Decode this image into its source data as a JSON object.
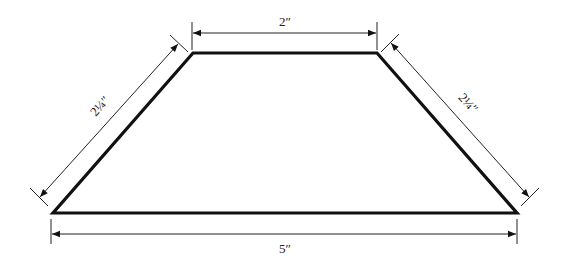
{
  "diagram": {
    "shape": "trapezoid",
    "colors": {
      "stroke": "#111111",
      "dim": "#222222",
      "background": "#ffffff"
    },
    "vertices": {
      "top_left": [
        193,
        53
      ],
      "top_right": [
        377,
        53
      ],
      "bottom_right": [
        517,
        213
      ],
      "bottom_left": [
        53,
        213
      ]
    },
    "dimensions": {
      "top": {
        "label": "2″",
        "value": "2 in"
      },
      "bottom": {
        "label": "5″",
        "value": "5 in"
      },
      "left": {
        "label": "2¼″",
        "value": "2 1/4 in"
      },
      "right": {
        "label": "2¼″",
        "value": "2 1/4 in"
      }
    }
  }
}
